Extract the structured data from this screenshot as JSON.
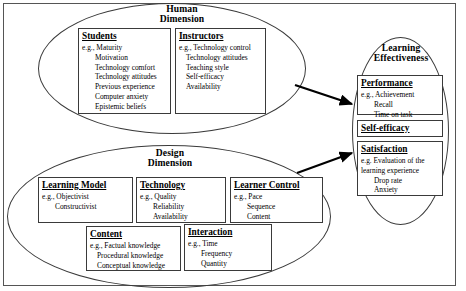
{
  "figure": {
    "type": "conceptual-framework-diagram",
    "outer_frame": true
  },
  "human_dimension": {
    "title_line1": "Human",
    "title_line2": "Dimension",
    "cards": [
      {
        "key": "students",
        "title": "Students",
        "eg": "e.g., Maturity",
        "items": [
          "Motivation",
          "Technology comfort",
          "Technology attitudes",
          "Previous experience",
          "Computer anxiety",
          "Epistemic beliefs"
        ]
      },
      {
        "key": "instructors",
        "title": "Instructors",
        "eg": "e.g., Technology control",
        "items": [
          "Technology attitudes",
          "Teaching style",
          "Self-efficacy",
          "Availability"
        ]
      }
    ]
  },
  "design_dimension": {
    "title_line1": "Design",
    "title_line2": "Dimension",
    "cards": [
      {
        "key": "learning-model",
        "title": "Learning Model",
        "eg": "e.g., Objectivist",
        "items": [
          "Constructivist"
        ]
      },
      {
        "key": "technology",
        "title": "Technology",
        "eg": "e.g., Quality",
        "items": [
          "Reliability",
          "Availability"
        ]
      },
      {
        "key": "learner-control",
        "title": "Learner Control",
        "eg": "e.g., Pace",
        "items": [
          "Sequence",
          "Content"
        ]
      },
      {
        "key": "content",
        "title": "Content",
        "eg": "e.g., Factual knowledge",
        "items": [
          "Procedural knowledge",
          "Conceptual knowledge"
        ]
      },
      {
        "key": "interaction",
        "title": "Interaction",
        "eg": "e.g., Time",
        "items": [
          "Frequency",
          "Quantity"
        ]
      }
    ]
  },
  "learning_effectiveness": {
    "title_line1": "Learning",
    "title_line2": "Effectiveness",
    "cards": [
      {
        "key": "performance",
        "title": "Performance",
        "eg": "e.g., Achievement",
        "items": [
          "Recall",
          "Time on task"
        ]
      },
      {
        "key": "self-efficacy",
        "title": "Self-efficacy",
        "eg": "",
        "items": []
      },
      {
        "key": "satisfaction",
        "title": "Satisfaction",
        "eg": "e.g. Evaluation of the",
        "items": [
          "learning experience",
          "Drop rate",
          "Anxiety"
        ]
      }
    ]
  },
  "arrows": [
    {
      "key": "human-to-effectiveness",
      "from": "human_dimension",
      "to": "learning_effectiveness"
    },
    {
      "key": "design-to-effectiveness",
      "from": "design_dimension",
      "to": "learning_effectiveness"
    }
  ],
  "colors": {
    "stroke": "#3a3a3a",
    "frame": "#555555",
    "arrow": "#000000",
    "background": "#ffffff"
  }
}
